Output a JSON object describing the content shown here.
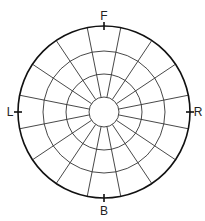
{
  "diagram": {
    "type": "polar-segmented-circle",
    "center": [
      104,
      112
    ],
    "ring_radii": [
      15,
      38,
      61,
      86
    ],
    "spoke_count": 16,
    "spoke_offset_deg": 11.25,
    "stroke_color": "#333333",
    "outer_stroke_color": "#111111",
    "labels": {
      "front": "F",
      "back": "B",
      "left": "L",
      "right": "R"
    }
  }
}
